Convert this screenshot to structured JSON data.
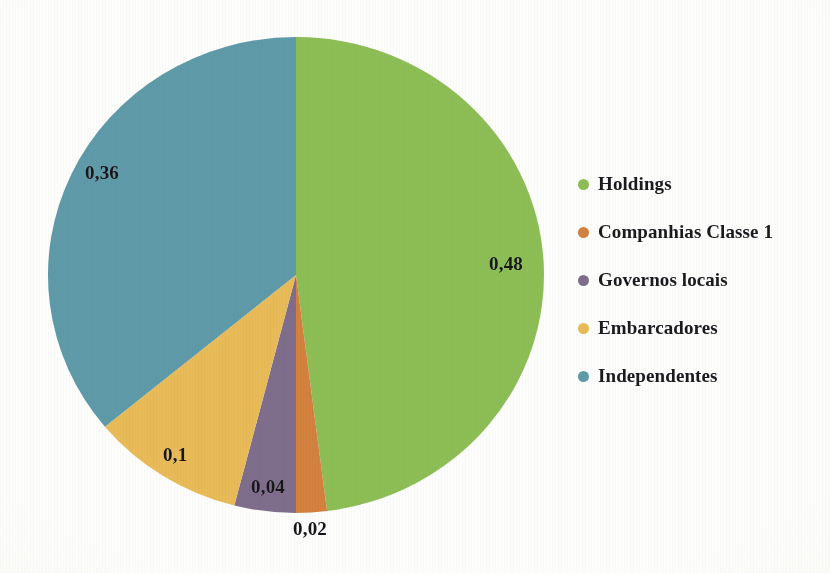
{
  "chart_data": {
    "type": "pie",
    "title": "",
    "subtitle": "",
    "xlabel": "",
    "ylabel": "",
    "grid": false,
    "legend_position": "right",
    "decimal_separator": ",",
    "start_angle_deg": 0,
    "direction": "clockwise",
    "categories": [
      "Holdings",
      "Companhias Classe 1",
      "Governos locais",
      "Embarcadores",
      "Independentes"
    ],
    "values": [
      0.48,
      0.02,
      0.04,
      0.1,
      0.36
    ],
    "value_labels": [
      "0,48",
      "0,02",
      "0,04",
      "0,1",
      "0,36"
    ],
    "colors": [
      "#8CBE55",
      "#D2813F",
      "#7E6E8C",
      "#E8BB58",
      "#5F9AA8"
    ],
    "slices": [
      {
        "name": "Holdings",
        "value": 0.48,
        "label": "0,48",
        "color": "#8CBE55",
        "label_left": 489,
        "label_top": 253,
        "label_inside": true
      },
      {
        "name": "Companhias Classe 1",
        "value": 0.02,
        "label": "0,02",
        "color": "#D2813F",
        "label_left": 293,
        "label_top": 518,
        "label_inside": false
      },
      {
        "name": "Governos locais",
        "value": 0.04,
        "label": "0,04",
        "color": "#7E6E8C",
        "label_left": 251,
        "label_top": 476,
        "label_inside": true
      },
      {
        "name": "Embarcadores",
        "value": 0.1,
        "label": "0,1",
        "color": "#E8BB58",
        "label_left": 163,
        "label_top": 444,
        "label_inside": true
      },
      {
        "name": "Independentes",
        "value": 0.36,
        "label": "0,36",
        "color": "#5F9AA8",
        "label_left": 85,
        "label_top": 162,
        "label_inside": true
      }
    ],
    "geometry": {
      "center_x": 296,
      "center_y": 275,
      "radius_x": 248,
      "radius_y": 238
    }
  },
  "legend": {
    "items": [
      {
        "label": "Holdings",
        "color": "#8CBE55"
      },
      {
        "label": "Companhias Classe 1",
        "color": "#D2813F"
      },
      {
        "label": "Governos locais",
        "color": "#7E6E8C"
      },
      {
        "label": "Embarcadores",
        "color": "#E8BB58"
      },
      {
        "label": "Independentes",
        "color": "#5F9AA8"
      }
    ]
  }
}
